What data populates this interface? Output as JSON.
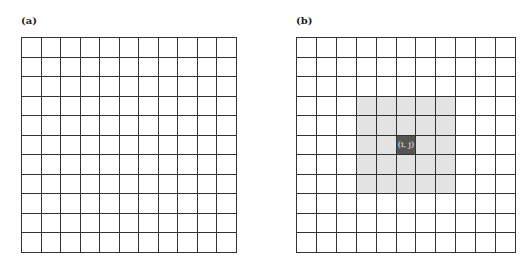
{
  "panels": [
    {
      "label": "(a)",
      "rows": 11,
      "cols": 11,
      "highlight": null
    },
    {
      "label": "(b)",
      "rows": 11,
      "cols": 11,
      "highlight": {
        "neighborhood": {
          "row_start": 3,
          "row_end": 7,
          "col_start": 3,
          "col_end": 7
        },
        "center": {
          "row": 5,
          "col": 5,
          "label": "(i, j)"
        }
      }
    }
  ],
  "colors": {
    "grid_line": "#333333",
    "neighborhood_fill": "#e3e3e3",
    "center_fill": "#555555"
  }
}
